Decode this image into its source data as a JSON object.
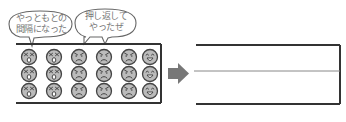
{
  "bubbles": [
    {
      "line1": "やっともとの",
      "line2": "間隔になった"
    },
    {
      "line1": "押し返して",
      "line2": "やったぜ"
    }
  ],
  "left_box": {
    "columns": [
      "shocked",
      "shocked",
      "angry",
      "angry",
      "angry",
      "happy"
    ],
    "rows": 3
  },
  "arrow": {
    "direction": "right",
    "color": "#777777"
  },
  "right_box": {
    "divider": "middle-line"
  },
  "colors": {
    "border": "#333333",
    "face_fill": "#bbbbbb",
    "face_stroke": "#444444",
    "divider": "#888888",
    "bubble_stroke": "#666666"
  }
}
